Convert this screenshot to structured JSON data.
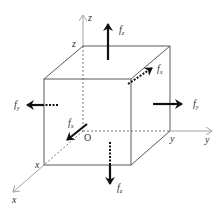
{
  "diagram": {
    "colors": {
      "edge": "#5a5a5a",
      "axis": "#9a9a9a",
      "force": "#111111",
      "text": "#333333",
      "background": "#ffffff"
    },
    "axes": {
      "z": {
        "label": "z",
        "corner_label": "z"
      },
      "y": {
        "label": "y",
        "corner_label": "y"
      },
      "x": {
        "label": "x",
        "corner_label": "x"
      },
      "origin": {
        "label": "O"
      }
    },
    "forces": [
      {
        "id": "fz-top",
        "symbol": "f",
        "subscript": "z",
        "direction": "up",
        "face": "top"
      },
      {
        "id": "fz-bottom",
        "symbol": "f",
        "subscript": "z",
        "direction": "down",
        "face": "bottom"
      },
      {
        "id": "fy-right",
        "symbol": "f",
        "subscript": "y",
        "direction": "right",
        "face": "right"
      },
      {
        "id": "fy-left",
        "symbol": "f",
        "subscript": "y",
        "direction": "left",
        "face": "left"
      },
      {
        "id": "fx-back",
        "symbol": "f",
        "subscript": "x",
        "direction": "back",
        "face": "back"
      },
      {
        "id": "fx-front",
        "symbol": "f",
        "subscript": "x",
        "direction": "front",
        "face": "front"
      }
    ]
  }
}
